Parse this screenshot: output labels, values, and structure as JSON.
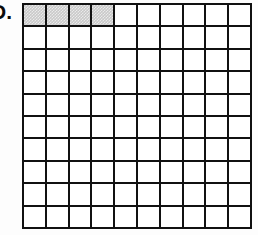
{
  "figure": {
    "label": "D.",
    "type": "hundredths-grid",
    "rows": 10,
    "columns": 10,
    "total_cells": 100,
    "shaded_cells": 4,
    "unshaded_cells": 96,
    "shaded_positions": [
      {
        "row": 1,
        "column": 1
      },
      {
        "row": 1,
        "column": 2
      },
      {
        "row": 1,
        "column": 3
      },
      {
        "row": 1,
        "column": 4
      }
    ],
    "fraction": "4/100",
    "decimal": "0.04",
    "percent": "4%"
  },
  "colors": {
    "grid_line": "#111111",
    "cell_fill": "#ffffff",
    "shaded_fill": "#c9c9c9",
    "page_background": "#fdfdfd",
    "label_color": "#0b0b0b"
  },
  "chart_data": {
    "type": "heatmap",
    "title": "",
    "xlabel": "",
    "ylabel": "",
    "rows": 10,
    "columns": 10,
    "legend": [],
    "grid": true,
    "values": [
      [
        1,
        1,
        1,
        1,
        0,
        0,
        0,
        0,
        0,
        0
      ],
      [
        0,
        0,
        0,
        0,
        0,
        0,
        0,
        0,
        0,
        0
      ],
      [
        0,
        0,
        0,
        0,
        0,
        0,
        0,
        0,
        0,
        0
      ],
      [
        0,
        0,
        0,
        0,
        0,
        0,
        0,
        0,
        0,
        0
      ],
      [
        0,
        0,
        0,
        0,
        0,
        0,
        0,
        0,
        0,
        0
      ],
      [
        0,
        0,
        0,
        0,
        0,
        0,
        0,
        0,
        0,
        0
      ],
      [
        0,
        0,
        0,
        0,
        0,
        0,
        0,
        0,
        0,
        0
      ],
      [
        0,
        0,
        0,
        0,
        0,
        0,
        0,
        0,
        0,
        0
      ],
      [
        0,
        0,
        0,
        0,
        0,
        0,
        0,
        0,
        0,
        0
      ],
      [
        0,
        0,
        0,
        0,
        0,
        0,
        0,
        0,
        0,
        0
      ]
    ]
  }
}
